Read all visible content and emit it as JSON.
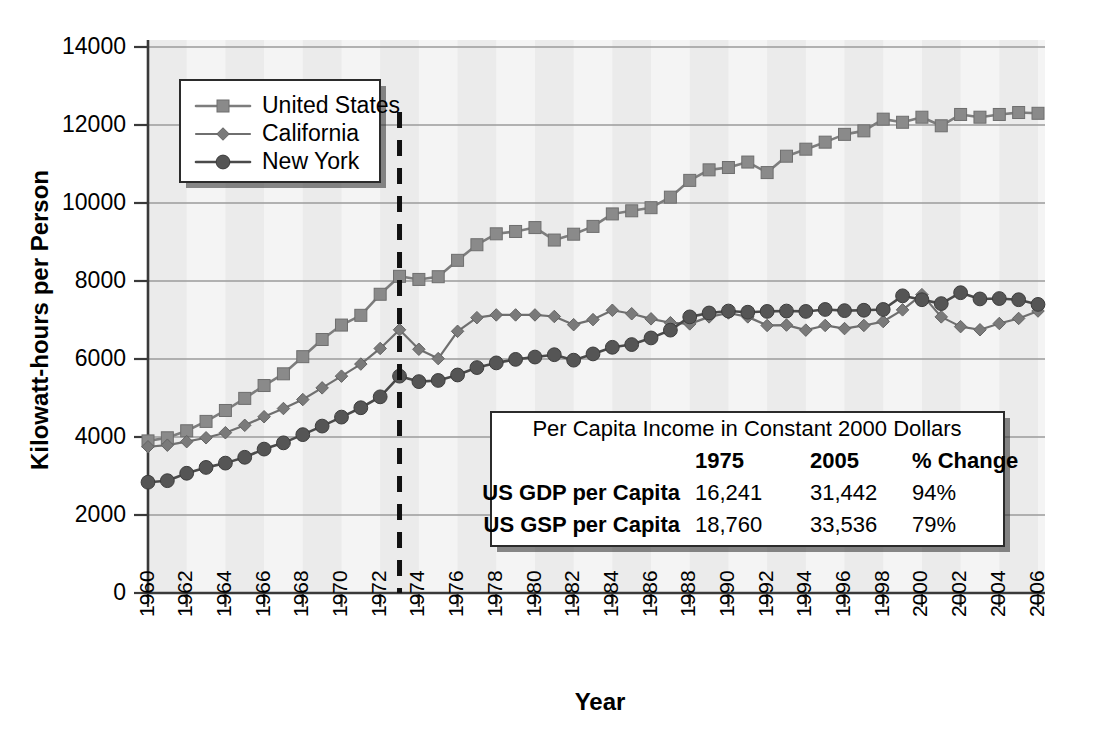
{
  "chart_data": {
    "type": "line",
    "title": "",
    "xlabel": "Year",
    "ylabel": "Kilowatt-hours per Person",
    "xlim": [
      1960,
      2006
    ],
    "ylim": [
      0,
      14000
    ],
    "ytick_values": [
      0,
      2000,
      4000,
      6000,
      8000,
      10000,
      12000,
      14000
    ],
    "ytick_labels": [
      "0",
      "2000",
      "4000",
      "6000",
      "8000",
      "10000",
      "12000",
      "14000"
    ],
    "xtick_labels": [
      "1960",
      "1962",
      "1964",
      "1966",
      "1968",
      "1970",
      "1972",
      "1974",
      "1976",
      "1978",
      "1980",
      "1982",
      "1984",
      "1986",
      "1988",
      "1990",
      "1992",
      "1994",
      "1996",
      "1998",
      "2000",
      "2002",
      "2004",
      "2006"
    ],
    "grid": "horizontal",
    "legend_position": "top-left-inside",
    "x": [
      1960,
      1961,
      1962,
      1963,
      1964,
      1965,
      1966,
      1967,
      1968,
      1969,
      1970,
      1971,
      1972,
      1973,
      1974,
      1975,
      1976,
      1977,
      1978,
      1979,
      1980,
      1981,
      1982,
      1983,
      1984,
      1985,
      1986,
      1987,
      1988,
      1989,
      1990,
      1991,
      1992,
      1993,
      1994,
      1995,
      1996,
      1997,
      1998,
      1999,
      2000,
      2001,
      2002,
      2003,
      2004,
      2005,
      2006
    ],
    "series": [
      {
        "name": "United States",
        "marker": "square",
        "color": "#8a8a8a",
        "values": [
          3900,
          3980,
          4160,
          4400,
          4680,
          4990,
          5320,
          5620,
          6060,
          6500,
          6870,
          7120,
          7660,
          8120,
          8040,
          8110,
          8530,
          8930,
          9210,
          9270,
          9370,
          9050,
          9200,
          9400,
          9720,
          9800,
          9880,
          10150,
          10580,
          10850,
          10910,
          11050,
          10780,
          11200,
          11380,
          11560,
          11760,
          11850,
          12150,
          12070,
          12200,
          11980,
          12270,
          12200,
          12270,
          12320,
          12300
        ]
      },
      {
        "name": "California",
        "marker": "diamond",
        "color": "#7a7a7a",
        "values": [
          3750,
          3790,
          3880,
          3980,
          4110,
          4300,
          4520,
          4730,
          4960,
          5260,
          5560,
          5870,
          6270,
          6750,
          6250,
          6010,
          6710,
          7060,
          7130,
          7130,
          7130,
          7090,
          6880,
          7010,
          7250,
          7160,
          7030,
          6930,
          6900,
          7080,
          7180,
          7080,
          6860,
          6870,
          6740,
          6860,
          6780,
          6860,
          6960,
          7260,
          7650,
          7080,
          6830,
          6750,
          6910,
          7040,
          7230
        ]
      },
      {
        "name": "New York",
        "marker": "circle",
        "color": "#555555",
        "values": [
          2840,
          2880,
          3070,
          3220,
          3330,
          3480,
          3690,
          3850,
          4060,
          4280,
          4510,
          4750,
          5030,
          5560,
          5420,
          5450,
          5590,
          5780,
          5900,
          5990,
          6050,
          6110,
          5970,
          6130,
          6300,
          6370,
          6540,
          6740,
          7080,
          7180,
          7230,
          7200,
          7220,
          7230,
          7220,
          7270,
          7240,
          7250,
          7270,
          7620,
          7520,
          7420,
          7700,
          7540,
          7550,
          7520,
          7400
        ]
      }
    ],
    "annotations": [
      {
        "type": "vline",
        "x": 1973,
        "style": "dashed",
        "color": "#111111"
      }
    ]
  },
  "legend": {
    "items": [
      {
        "label": "United States",
        "marker": "square"
      },
      {
        "label": "California",
        "marker": "diamond"
      },
      {
        "label": "New York",
        "marker": "circle"
      }
    ]
  },
  "inset_table": {
    "title": "Per Capita Income in Constant 2000 Dollars",
    "columns": [
      "",
      "1975",
      "2005",
      "% Change"
    ],
    "rows": [
      {
        "label": "US GDP per Capita",
        "v1975": "16,241",
        "v2005": "31,442",
        "change": "94%"
      },
      {
        "label": "US GSP per Capita",
        "v1975": "18,760",
        "v2005": "33,536",
        "change": "79%"
      }
    ]
  }
}
